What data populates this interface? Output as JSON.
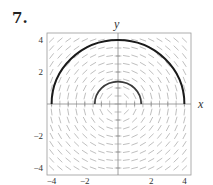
{
  "problem_number": "7.",
  "chart_data": {
    "type": "slope_field",
    "title": "",
    "xlabel": "x",
    "ylabel": "y",
    "xlim": [
      -4.3,
      4.3
    ],
    "ylim": [
      -4.3,
      4.3
    ],
    "x_ticks": [
      {
        "value": -4,
        "label": "−4"
      },
      {
        "value": -2,
        "label": "−2"
      },
      {
        "value": 2,
        "label": "2"
      },
      {
        "value": 4,
        "label": "4"
      }
    ],
    "y_ticks": [
      {
        "value": 4,
        "label": "4"
      },
      {
        "value": 2,
        "label": "2"
      },
      {
        "value": -2,
        "label": "−2"
      },
      {
        "value": -4,
        "label": "−4"
      }
    ],
    "slope_field": {
      "equation": "dy/dx = -x/y",
      "grid_range": [
        -4,
        4
      ],
      "grid_step": 0.5
    },
    "solution_curves": [
      {
        "name": "outer-semicircle",
        "shape": "upper semicircle",
        "radius": 4,
        "center": [
          0,
          0
        ]
      },
      {
        "name": "inner-semicircle",
        "shape": "upper semicircle",
        "radius": 1.4,
        "center": [
          0,
          0
        ]
      }
    ],
    "grid": false,
    "legend": "none"
  },
  "colors": {
    "frame": "#9a9a9a",
    "axes": "#888888",
    "segments": "#b8b8b8",
    "curve_outer": "#1a1a1a",
    "curve_inner": "#3a3a3a"
  }
}
